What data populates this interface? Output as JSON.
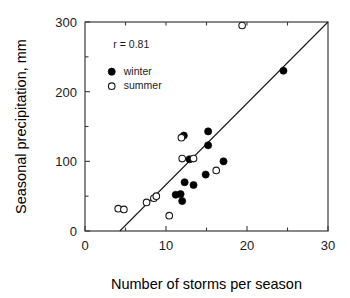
{
  "chart_data": {
    "type": "scatter",
    "title": "",
    "xlabel": "Number of storms per season",
    "ylabel": "Seasonal precipitation, mm",
    "xlim": [
      0,
      30
    ],
    "ylim": [
      0,
      300
    ],
    "xticks": [
      0,
      10,
      20,
      30
    ],
    "yticks": [
      0,
      100,
      200,
      300
    ],
    "xtick_labels": [
      "0",
      "10",
      "20",
      "30"
    ],
    "ytick_labels": [
      "0",
      "100",
      "200",
      "300"
    ],
    "grid": false,
    "legend_position": "top-left",
    "annotations": [
      {
        "text": "r  =  0.81",
        "x": 3.5,
        "y": 268
      }
    ],
    "correlation_label": "r  =  0.81",
    "correlation_value": 0.81,
    "series": [
      {
        "name": "winter",
        "marker": "filled-circle",
        "color": "#000000",
        "points": [
          {
            "x": 11.2,
            "y": 52
          },
          {
            "x": 11.8,
            "y": 53
          },
          {
            "x": 12.0,
            "y": 43
          },
          {
            "x": 12.2,
            "y": 137
          },
          {
            "x": 12.3,
            "y": 70
          },
          {
            "x": 12.9,
            "y": 103
          },
          {
            "x": 13.4,
            "y": 66
          },
          {
            "x": 14.9,
            "y": 81
          },
          {
            "x": 15.2,
            "y": 143
          },
          {
            "x": 15.2,
            "y": 123
          },
          {
            "x": 17.1,
            "y": 100
          },
          {
            "x": 24.5,
            "y": 230
          }
        ]
      },
      {
        "name": "summer",
        "marker": "open-circle",
        "color": "#ffffff",
        "points": [
          {
            "x": 4.1,
            "y": 32
          },
          {
            "x": 4.8,
            "y": 31
          },
          {
            "x": 7.6,
            "y": 41
          },
          {
            "x": 8.5,
            "y": 47
          },
          {
            "x": 8.8,
            "y": 50
          },
          {
            "x": 10.4,
            "y": 22
          },
          {
            "x": 11.9,
            "y": 134
          },
          {
            "x": 12.0,
            "y": 104
          },
          {
            "x": 13.4,
            "y": 104
          },
          {
            "x": 16.2,
            "y": 87
          },
          {
            "x": 19.4,
            "y": 295
          }
        ]
      }
    ],
    "fit_line": {
      "name": "regression-line",
      "x0": 4.3,
      "y0": 0,
      "x1": 30.0,
      "y1": 300
    }
  },
  "legend": {
    "items": [
      {
        "label": "winter",
        "marker": "filled-circle"
      },
      {
        "label": "summer",
        "marker": "open-circle"
      }
    ]
  },
  "colors": {
    "axis": "#3a3a3a",
    "text": "#1a1a1a",
    "winter_marker": "#000000",
    "summer_marker": "#ffffff",
    "background": "#ffffff"
  }
}
